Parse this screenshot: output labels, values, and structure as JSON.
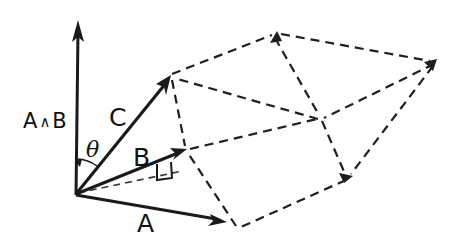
{
  "figure": {
    "kind": "vector-diagram",
    "background_color": "#ffffff",
    "ink_color": "#1a1a1a",
    "width": 453,
    "height": 246,
    "labels": {
      "bivector_axis": "A",
      "bivector_wedge": "∧",
      "bivector_axis_second": "B",
      "vector_c": "C",
      "vector_b": "B",
      "vector_a": "A",
      "angle": "θ"
    },
    "geometry": {
      "origin": {
        "x": 75,
        "y": 195
      },
      "axis_tip": {
        "x": 78,
        "y": 22
      },
      "vector_c_tip": {
        "x": 170,
        "y": 76
      },
      "vector_b_tip": {
        "x": 186,
        "y": 150
      },
      "vector_a_tip": {
        "x": 226,
        "y": 222
      },
      "parallelepiped_vertices": {
        "top_back": {
          "x": 277,
          "y": 33
        },
        "top_right": {
          "x": 435,
          "y": 62
        },
        "mid_right": {
          "x": 350,
          "y": 178
        },
        "bottom_front": {
          "x": 237,
          "y": 228
        },
        "mid_center": {
          "x": 320,
          "y": 117
        }
      },
      "right_angle_marker": {
        "x": 157,
        "y": 163,
        "size": 15
      },
      "angle_arc_radius": 36
    }
  }
}
